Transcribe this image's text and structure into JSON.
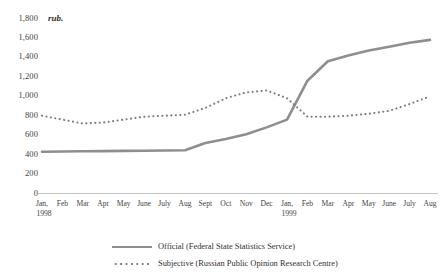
{
  "chart_data": {
    "type": "line",
    "title": "",
    "subtitle": "",
    "xlabel": "",
    "ylabel": "rub.",
    "ylim": [
      0,
      1800
    ],
    "ytick_labels": [
      "1,800",
      "1,600",
      "1,400",
      "1,200",
      "1,000",
      "800",
      "600",
      "400",
      "200",
      "0"
    ],
    "ytick_values": [
      1800,
      1600,
      1400,
      1200,
      1000,
      800,
      600,
      400,
      200,
      0
    ],
    "grid": false,
    "legend_position": "bottom",
    "categories": [
      "Jan,",
      "Feb",
      "Mar",
      "Apr",
      "May",
      "June",
      "July",
      "Aug",
      "Sept",
      "Oct",
      "Nov",
      "Dec",
      "Jan,",
      "Feb",
      "Mar",
      "Apr",
      "May",
      "June",
      "July",
      "Aug"
    ],
    "year_labels": [
      {
        "label": "1998",
        "at_category_index": 0
      },
      {
        "label": "1999",
        "at_category_index": 12
      }
    ],
    "series": [
      {
        "name": "Official (Federal State Statistics Service)",
        "style": "solid",
        "color": "#8e8e8e",
        "values": [
          430,
          432,
          434,
          436,
          438,
          440,
          442,
          445,
          520,
          560,
          610,
          680,
          760,
          1160,
          1360,
          1420,
          1470,
          1510,
          1550,
          1580
        ]
      },
      {
        "name": "Subjective (Russian Public Opinion Research Centre)",
        "style": "dotted",
        "color": "#7d7d7d",
        "values": [
          800,
          760,
          720,
          730,
          760,
          790,
          800,
          810,
          880,
          980,
          1040,
          1060,
          980,
          790,
          790,
          800,
          820,
          850,
          920,
          1000
        ]
      }
    ]
  },
  "legend": {
    "entries": [
      {
        "label": "Official (Federal State Statistics Service)",
        "style": "solid"
      },
      {
        "label": "Subjective (Russian Public Opinion Research Centre)",
        "style": "dotted"
      }
    ]
  }
}
